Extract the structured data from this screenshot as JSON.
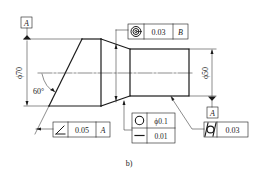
{
  "figure": {
    "caption": "b)",
    "dimensions": {
      "large_diameter": "ϕ70",
      "small_diameter": "ϕ50",
      "chamfer_angle": "60°"
    },
    "datums": {
      "top_left": "A",
      "right_bottom": "A"
    },
    "feature_control_frames": {
      "concentricity": {
        "symbol": "concentricity-icon",
        "tolerance": "0.03",
        "datum": "B"
      },
      "angularity": {
        "symbol": "angularity-icon",
        "tolerance": "0.05",
        "datum": "A"
      },
      "roundness": {
        "symbol": "circularity-icon",
        "tolerance": "ϕ0.1"
      },
      "straightness": {
        "symbol": "straightness-icon",
        "tolerance": "0.01"
      },
      "cylindricity": {
        "symbol": "cylindricity-icon",
        "tolerance": "0.03"
      }
    }
  },
  "colors": {
    "line": "#1a1a1a",
    "text": "#222222",
    "background": "#ffffff"
  }
}
